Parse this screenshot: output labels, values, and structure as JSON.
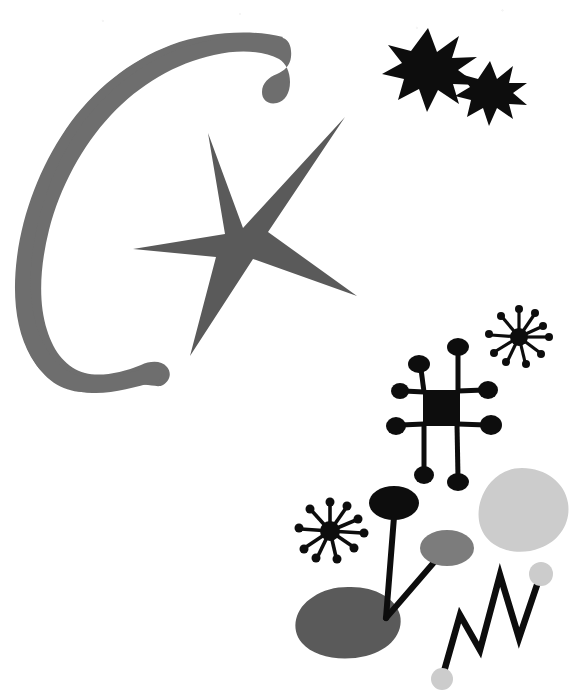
{
  "artwork": {
    "title": "Abstract composition with crescent, stars and constellation figures",
    "style": "mid-century surrealist line-and-blob painting",
    "background_color": "#ffffff",
    "canvas": {
      "width": 571,
      "height": 693
    }
  },
  "palette": {
    "black": "#0d0d0d",
    "dark_gray": "#5a5a5a",
    "mid_gray": "#6e6e6e",
    "medium_gray": "#7c7c7c",
    "light_gray": "#cccccc",
    "white": "#ffffff"
  },
  "shapes": [
    {
      "id": "crescent",
      "label": "Crescent moon arc",
      "color": "#6e6e6e",
      "position": {
        "x": 14,
        "y": 33,
        "width": 270,
        "height": 362
      },
      "description": "Thick tapering open arc opening to the right, with a rounded knob at its lower tip"
    },
    {
      "id": "big-star",
      "label": "Large five-pointed star",
      "color": "#5a5a5a",
      "position": {
        "x": 132,
        "y": 116,
        "width": 226,
        "height": 240
      },
      "points": 5,
      "description": "Irregular asymmetric star with long thin arms"
    },
    {
      "id": "black-star-large",
      "label": "Large black eight-pointed star",
      "color": "#0d0d0d",
      "position": {
        "x": 392,
        "y": 28,
        "width": 72,
        "height": 72
      },
      "points": 8
    },
    {
      "id": "black-star-small",
      "label": "Small black eight-pointed star",
      "color": "#0d0d0d",
      "position": {
        "x": 462,
        "y": 60,
        "width": 54,
        "height": 54
      },
      "points": 8
    },
    {
      "id": "constellation-square",
      "label": "Black square constellation figure with eight radiating dotted arms",
      "color": "#0d0d0d",
      "position": {
        "x": 398,
        "y": 336,
        "width": 106,
        "height": 152
      },
      "arms": 8
    },
    {
      "id": "starburst-upper",
      "label": "Upper starburst with dotted rays",
      "color": "#0d0d0d",
      "position": {
        "x": 490,
        "y": 306,
        "width": 62,
        "height": 62
      },
      "rays": 10
    },
    {
      "id": "starburst-lower",
      "label": "Lower starburst with dotted rays",
      "color": "#0d0d0d",
      "position": {
        "x": 296,
        "y": 498,
        "width": 72,
        "height": 64
      },
      "rays": 10
    },
    {
      "id": "light-blob",
      "label": "Light gray rounded blob",
      "color": "#cccccc",
      "position": {
        "x": 480,
        "y": 468,
        "width": 88,
        "height": 82
      }
    },
    {
      "id": "dark-blob",
      "label": "Dark gray rounded blob base",
      "color": "#5a5a5a",
      "position": {
        "x": 296,
        "y": 587,
        "width": 105,
        "height": 69
      }
    },
    {
      "id": "black-oval-stem",
      "label": "Black oval on a stem",
      "color": "#0d0d0d",
      "position": {
        "x": 370,
        "y": 487,
        "width": 50,
        "height": 33
      }
    },
    {
      "id": "gray-oval-stem",
      "label": "Medium gray oval on a stem",
      "color": "#7c7c7c",
      "position": {
        "x": 420,
        "y": 531,
        "width": 54,
        "height": 35
      }
    },
    {
      "id": "zigzag",
      "label": "Zigzag lightning line with gray dots at both ends",
      "color": "#0d0d0d",
      "position": {
        "x": 438,
        "y": 570,
        "width": 110,
        "height": 112
      },
      "endpoint_dot_color": "#cccccc"
    }
  ],
  "labels": {
    "artboard": "Artwork canvas"
  }
}
